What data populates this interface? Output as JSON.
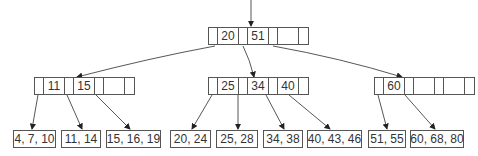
{
  "diagram": {
    "type": "b-tree",
    "root": {
      "keys": [
        "20",
        "51",
        ""
      ]
    },
    "internal": [
      {
        "keys": [
          "11",
          "15",
          ""
        ]
      },
      {
        "keys": [
          "25",
          "34",
          "40"
        ]
      },
      {
        "keys": [
          "60",
          "",
          ""
        ]
      }
    ],
    "leaves": [
      "4, 7, 10",
      "11, 14",
      "15, 16, 19",
      "20, 24",
      "25, 28",
      "34, 38",
      "40, 43, 46",
      "51, 55",
      "60, 68, 80"
    ],
    "colors": {
      "line": "#555555",
      "text": "#333333",
      "background": "#ffffff"
    }
  }
}
